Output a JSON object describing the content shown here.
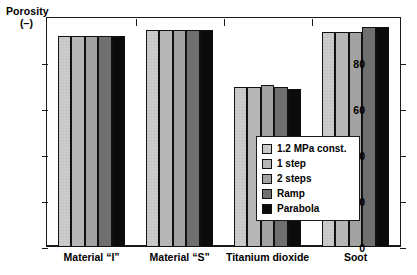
{
  "chart_data": {
    "type": "bar",
    "title": "",
    "ylabel": "Porosity",
    "ylabel_unit": "(–)",
    "xlabel": "",
    "ylim": [
      0,
      100
    ],
    "yticks": [
      0,
      20,
      40,
      60,
      80
    ],
    "ytick_labels": [
      "0",
      "20",
      "40",
      "60",
      "80"
    ],
    "grid": false,
    "legend_position": "inside-center-right",
    "categories": [
      "Material “I”",
      "Material “S”",
      "Titanium dioxide",
      "Soot"
    ],
    "series": [
      {
        "name": "1.2 MPa const.",
        "color": "#c9c9c9",
        "values": [
          92,
          95,
          70,
          94
        ]
      },
      {
        "name": "1 step",
        "color": "#b6b6b6",
        "values": [
          92,
          95,
          70,
          94
        ]
      },
      {
        "name": "2 steps",
        "color": "#a2a2a2",
        "values": [
          92,
          95,
          71,
          94
        ]
      },
      {
        "name": "Ramp",
        "color": "#6f6f6f",
        "values": [
          92,
          95,
          70,
          96
        ]
      },
      {
        "name": "Parabola",
        "color": "#0b0b0b",
        "values": [
          92,
          95,
          69,
          96
        ]
      }
    ]
  },
  "legend": {
    "items": [
      {
        "label": "1.2 MPa const."
      },
      {
        "label": "1 step"
      },
      {
        "label": "2 steps"
      },
      {
        "label": "Ramp"
      },
      {
        "label": "Parabola"
      }
    ]
  }
}
